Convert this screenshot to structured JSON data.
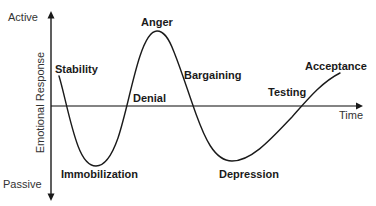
{
  "diagram": {
    "title": "",
    "type": "change-curve",
    "y_axis": {
      "label": "Emotional Response",
      "top_label": "Active",
      "bottom_label": "Passive"
    },
    "x_axis": {
      "label": "Time"
    },
    "stages": [
      {
        "id": "stability",
        "label": "Stability"
      },
      {
        "id": "immobilization",
        "label": "Immobilization"
      },
      {
        "id": "denial",
        "label": "Denial"
      },
      {
        "id": "anger",
        "label": "Anger"
      },
      {
        "id": "bargaining",
        "label": "Bargaining"
      },
      {
        "id": "depression",
        "label": "Depression"
      },
      {
        "id": "testing",
        "label": "Testing"
      },
      {
        "id": "acceptance",
        "label": "Acceptance"
      }
    ],
    "colors": {
      "curve": "#1a1a1a",
      "y_axis": "#1a1a1a",
      "x_axis": "#555555",
      "text": "#1a1a1a",
      "background": "#ffffff"
    }
  }
}
